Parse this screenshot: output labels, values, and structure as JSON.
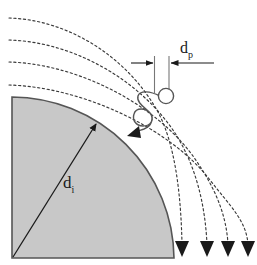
{
  "figure": {
    "background_color": "#ffffff",
    "line_color": "#333333",
    "stream_color": "#444444",
    "collector_fill": "#c8c8c8",
    "collector_stroke": "#555555"
  },
  "labels": {
    "particle_diameter": {
      "symbol": "d",
      "subscript": "p",
      "text": "d"
    },
    "collector_diameter": {
      "symbol": "d",
      "subscript": "i",
      "text": "d"
    }
  },
  "collector": {
    "name": "quarter-disc-collector",
    "fill": "#c8c8c8",
    "corner_x": 12,
    "corner_y": 258,
    "top_x": 12,
    "top_y": 97,
    "radius": 161,
    "radius_arrow": {
      "from_x": 13,
      "from_y": 257,
      "to_x": 96,
      "to_y": 124
    }
  },
  "streamlines": {
    "name": "streamlines",
    "count": 4,
    "dash": "2,3",
    "paths": [
      {
        "start_x": 10,
        "start_y": 18,
        "end_x": 182,
        "end_y": 244,
        "ctrl_x": 120,
        "ctrl_y": 40
      },
      {
        "start_x": 10,
        "start_y": 40,
        "end_x": 207,
        "end_y": 244,
        "ctrl_x": 140,
        "ctrl_y": 60
      },
      {
        "start_x": 10,
        "start_y": 62,
        "end_x": 228,
        "end_y": 244,
        "ctrl_x": 160,
        "ctrl_y": 80
      },
      {
        "start_x": 10,
        "start_y": 85,
        "end_x": 248,
        "end_y": 244,
        "ctrl_x": 180,
        "ctrl_y": 100
      }
    ],
    "arrow_tips_y": 256,
    "arrow_x": [
      182,
      207,
      228,
      248
    ]
  },
  "particle": {
    "name": "particle",
    "circle_x": 166,
    "circle_y": 96,
    "radius": 7.5,
    "trajectory_arrow": {
      "x": 133,
      "y": 134
    }
  },
  "dimension": {
    "name": "particle-diameter-dimension",
    "rule_y": 63,
    "left_tick_x": 154,
    "right_tick_x": 168,
    "tick_top_y": 56,
    "tick_bottom_y": 92,
    "left_arrow_from_x": 132,
    "right_arrow_from_x": 214,
    "label_x": 184,
    "label_y": 48
  }
}
